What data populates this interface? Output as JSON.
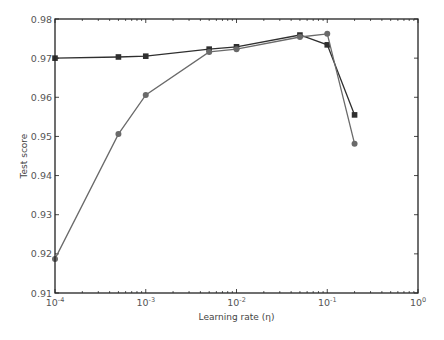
{
  "chart_data": {
    "type": "line",
    "title": "",
    "xlabel": "Learning rate (η)",
    "ylabel": "Test score",
    "xscale": "log",
    "xlim": [
      0.0001,
      1
    ],
    "ylim": [
      0.91,
      0.98
    ],
    "grid": false,
    "legend": null,
    "x_ticks": [
      {
        "value": 0.0001,
        "base": "10",
        "exp": "-4"
      },
      {
        "value": 0.001,
        "base": "10",
        "exp": "-3"
      },
      {
        "value": 0.01,
        "base": "10",
        "exp": "-2"
      },
      {
        "value": 0.1,
        "base": "10",
        "exp": "-1"
      },
      {
        "value": 1,
        "base": "10",
        "exp": "0"
      }
    ],
    "y_ticks": [
      "0.91",
      "0.92",
      "0.93",
      "0.94",
      "0.95",
      "0.96",
      "0.97",
      "0.98"
    ],
    "series": [
      {
        "name": "square-marker series",
        "marker": "square",
        "color": "#2f2f2f",
        "x": [
          0.0001,
          0.0005,
          0.001,
          0.005,
          0.01,
          0.05,
          0.1,
          0.2
        ],
        "values": [
          0.97,
          0.9703,
          0.9705,
          0.9723,
          0.9729,
          0.9759,
          0.9734,
          0.9555
        ]
      },
      {
        "name": "circle-marker series",
        "marker": "circle",
        "color": "#6a6a6a",
        "x": [
          0.0001,
          0.0005,
          0.001,
          0.005,
          0.01,
          0.05,
          0.1,
          0.2
        ],
        "values": [
          0.9187,
          0.9506,
          0.9606,
          0.9716,
          0.9723,
          0.9754,
          0.9762,
          0.9481
        ]
      }
    ]
  },
  "plot": {
    "left": 55,
    "right": 418,
    "top": 19,
    "bottom": 293
  }
}
